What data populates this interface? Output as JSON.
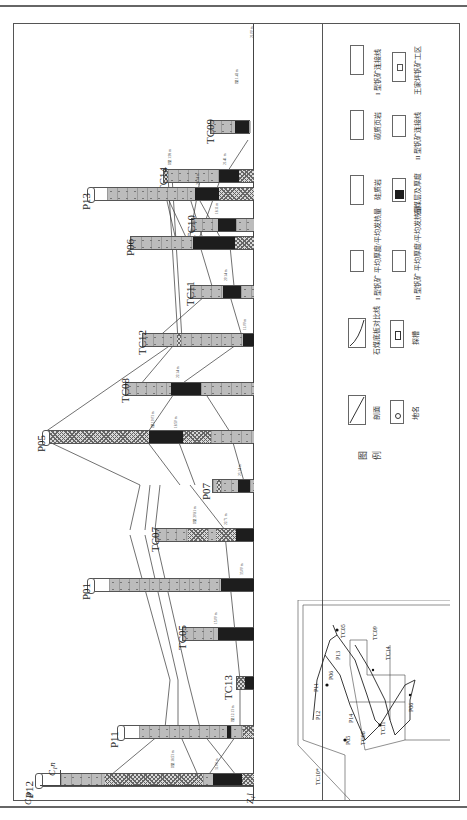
{
  "diagram": {
    "orientation": "rotated-90-ccw",
    "strata": {
      "left": "C₁y",
      "middle": "C₁n",
      "right": "Z₁l"
    },
    "columns": [
      {
        "name": "TC09",
        "y": 127
      },
      {
        "name": "TC14",
        "y": 173
      },
      {
        "name": "TC10",
        "y": 222
      },
      {
        "name": "P13",
        "y": 188
      },
      {
        "name": "P06",
        "y": 233
      },
      {
        "name": "TC11",
        "y": 283
      },
      {
        "name": "TC12",
        "y": 325
      },
      {
        "name": "TC08",
        "y": 370
      },
      {
        "name": "P05",
        "y": 420
      },
      {
        "name": "P07",
        "y": 470
      },
      {
        "name": "TC07",
        "y": 520
      },
      {
        "name": "P01",
        "y": 569
      },
      {
        "name": "TC05",
        "y": 618
      },
      {
        "name": "TC13",
        "y": 668
      },
      {
        "name": "P11",
        "y": 717
      },
      {
        "name": "P12",
        "y": 770
      }
    ],
    "annotations": {
      "thickness_labels": [
        "21.00 m",
        "21.41 m",
        "18.11 m",
        "24.14 m",
        "42.19 m",
        "20.14 m",
        "11.00 m",
        "22.14 m",
        "18.50 m",
        "23.14 m",
        "22.71 m",
        "33.00 m",
        "15.00 m",
        "31.00 m"
      ],
      "ore_labels": [
        "I型 1.42 m",
        "II型 1.98 m",
        "I型 10.03 m",
        "II型 20.81 m",
        "I型 12.13 m",
        "II型 18.53 m"
      ]
    }
  },
  "legend": {
    "title_1": "图",
    "title_2": "例",
    "items": [
      {
        "symbol": "sandstone",
        "label": "硅质岩"
      },
      {
        "symbol": "shale",
        "label": "碳质页岩"
      },
      {
        "symbol": "ore-I-connect",
        "label": "I 型钒矿连接线"
      },
      {
        "symbol": "coal",
        "label": "石煤层及厚度"
      },
      {
        "symbol": "ore-II-connect",
        "label": "II 型钒矿连接线"
      },
      {
        "symbol": "work-area",
        "label": "王家坪钒矿工区"
      },
      {
        "symbol": "section",
        "label": "剖面"
      },
      {
        "symbol": "place-name",
        "label": "地名"
      },
      {
        "symbol": "coal-floor",
        "label": "石煤底板对比线"
      },
      {
        "symbol": "trench",
        "label": "探槽"
      },
      {
        "symbol": "ore-I-avg",
        "label": "I 型钒矿 平均厚度/平均发热量"
      },
      {
        "symbol": "ore-II-avg",
        "label": "II 型钒矿 平均厚度/平均发热量"
      }
    ],
    "coal_sample_value": "21.00 m"
  },
  "location_map": {
    "labels": [
      "TC01",
      "TC02",
      "TC03",
      "TC04",
      "TC05",
      "TC06",
      "TC07",
      "TC08",
      "TC09",
      "TC10",
      "TC11",
      "TC12",
      "TC13",
      "TC14",
      "P01",
      "P02",
      "P03",
      "P05",
      "P06",
      "P07",
      "P11",
      "P12",
      "P13",
      "P14",
      "TC10*"
    ],
    "section_label": "钒矿工区"
  }
}
